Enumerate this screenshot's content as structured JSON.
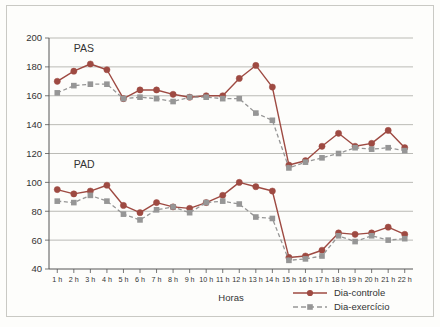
{
  "chart_data": {
    "type": "line",
    "title": "",
    "xlabel": "Horas",
    "ylabel": "",
    "ylim": [
      40,
      200
    ],
    "yticks": [
      40,
      60,
      80,
      100,
      120,
      140,
      160,
      180,
      200
    ],
    "grid": true,
    "legend_position": "bottom-right",
    "panel_annotations": [
      {
        "text": "PAS",
        "x_hour": 2,
        "y_value": 190
      },
      {
        "text": "PAD",
        "x_hour": 2,
        "y_value": 110
      }
    ],
    "categories": [
      "1 h",
      "2 h",
      "3 h",
      "4 h",
      "5 h",
      "6 h",
      "7 h",
      "8 h",
      "9 h",
      "10 h",
      "11 h",
      "12 h",
      "13 h",
      "14 h",
      "15 h",
      "16 h",
      "17 h",
      "18 h",
      "19 h",
      "20 h",
      "21 h",
      "22 h"
    ],
    "series": [
      {
        "name": "Dia-controle",
        "measure": "PAS",
        "color": "#9e4a42",
        "marker": "circle",
        "linestyle": "solid",
        "values": [
          170,
          177,
          182,
          178,
          158,
          164,
          164,
          161,
          159,
          160,
          160,
          172,
          181,
          166,
          112,
          115,
          125,
          134,
          125,
          127,
          136,
          124
        ]
      },
      {
        "name": "Dia-exercício",
        "measure": "PAS",
        "color": "#969696",
        "marker": "square",
        "linestyle": "dashed",
        "values": [
          162,
          167,
          168,
          168,
          158,
          159,
          158,
          156,
          159,
          159,
          158,
          158,
          148,
          143,
          110,
          114,
          117,
          120,
          124,
          123,
          124,
          122
        ]
      },
      {
        "name": "Dia-controle",
        "measure": "PAD",
        "color": "#9e4a42",
        "marker": "circle",
        "linestyle": "solid",
        "values": [
          95,
          92,
          94,
          98,
          84,
          79,
          86,
          83,
          82,
          86,
          91,
          100,
          97,
          94,
          48,
          49,
          53,
          65,
          64,
          65,
          69,
          64
        ]
      },
      {
        "name": "Dia-exercício",
        "measure": "PAD",
        "color": "#969696",
        "marker": "square",
        "linestyle": "dashed",
        "values": [
          87,
          86,
          91,
          87,
          78,
          74,
          81,
          83,
          79,
          86,
          87,
          85,
          76,
          75,
          46,
          47,
          49,
          63,
          59,
          63,
          60,
          61
        ]
      }
    ],
    "legend": [
      {
        "label": "Dia-controle",
        "color": "#9e4a42",
        "marker": "circle",
        "linestyle": "solid"
      },
      {
        "label": "Dia-exercício",
        "color": "#969696",
        "marker": "square",
        "linestyle": "dashed"
      }
    ]
  }
}
